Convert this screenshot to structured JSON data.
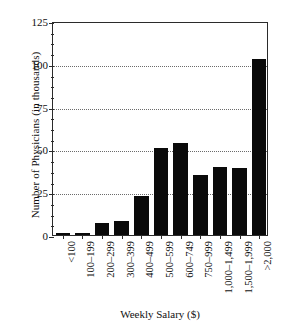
{
  "chart_data": {
    "type": "bar",
    "title": "",
    "xlabel": "Weekly Salary ($)",
    "ylabel": "Number of Physicians (in thousands)",
    "categories": [
      "<100",
      "100–199",
      "200–299",
      "300–399",
      "400–499",
      "500–599",
      "600–749",
      "750–999",
      "1,000–1,499",
      "1,500–1,999",
      ">2,000"
    ],
    "values": [
      1,
      1,
      7,
      8,
      23,
      51,
      54,
      35,
      40,
      39,
      103
    ],
    "ylim": [
      0,
      125
    ],
    "yticks": [
      0,
      25,
      50,
      75,
      100,
      125
    ],
    "ytick_labels": [
      "0",
      "25",
      "50",
      "75",
      "100",
      "125"
    ],
    "yminor_step": 6.25,
    "grid": "horizontal-dotted",
    "legend": "none",
    "bar_color": "#0a0a0a",
    "axis_color": "#2b2b2b",
    "grid_color": "#6b6b6b",
    "background": "#ffffff"
  }
}
